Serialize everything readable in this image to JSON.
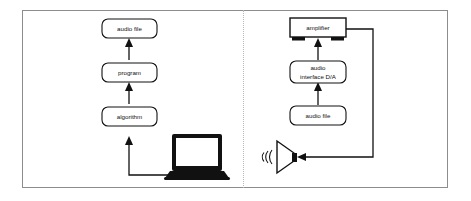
{
  "figure": {
    "background_color": "#ffffff",
    "border_color": "#8d8d8d",
    "line_color": "#111111",
    "divider_color": "#b8b8b8",
    "divider_style": "dotted-vertical"
  },
  "left_panel": {
    "name": "rendering-chain",
    "nodes": [
      {
        "id": "audio-file-out",
        "label": "audio file",
        "shape": "rounded-rect"
      },
      {
        "id": "program",
        "label": "program",
        "shape": "rounded-rect"
      },
      {
        "id": "algorithm",
        "label": "algorithm",
        "shape": "rounded-rect"
      }
    ],
    "device": {
      "id": "laptop",
      "label": "laptop",
      "shape": "laptop-silhouette"
    },
    "flow": [
      {
        "from": "laptop",
        "to": "algorithm",
        "direction": "up"
      },
      {
        "from": "algorithm",
        "to": "program",
        "direction": "up"
      },
      {
        "from": "program",
        "to": "audio-file-out",
        "direction": "up"
      }
    ]
  },
  "right_panel": {
    "name": "playback-chain",
    "nodes": [
      {
        "id": "amplifier",
        "label": "amplifier",
        "shape": "rect-with-feet"
      },
      {
        "id": "audio-interface",
        "label": "audio\ninterface D/A",
        "label_line1": "audio",
        "label_line2": "interface D/A",
        "shape": "rounded-rect"
      },
      {
        "id": "audio-file-in",
        "label": "audio file",
        "shape": "rounded-rect"
      }
    ],
    "device": {
      "id": "speaker",
      "label": "speaker",
      "shape": "horn-speaker"
    },
    "flow": [
      {
        "from": "audio-file-in",
        "to": "audio-interface",
        "direction": "up"
      },
      {
        "from": "audio-interface",
        "to": "amplifier",
        "direction": "up"
      },
      {
        "from": "amplifier",
        "to": "speaker",
        "direction": "right-down-left"
      }
    ]
  }
}
